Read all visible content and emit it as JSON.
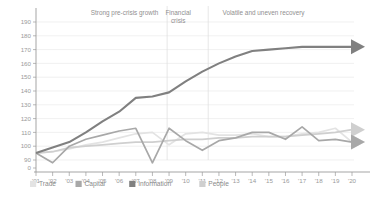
{
  "chart_data": {
    "type": "line",
    "title": "",
    "xlabel": "",
    "ylabel": "",
    "ylim": [
      90,
      195
    ],
    "grid": true,
    "legend_position": "bottom",
    "x": [
      "'01",
      "'02",
      "'03",
      "'04",
      "'05",
      "'06",
      "'07",
      "'08",
      "'09",
      "'10",
      "'11",
      "'12",
      "'13",
      "'14",
      "'15",
      "'16",
      "'17",
      "'18",
      "'19",
      "'20"
    ],
    "ytick_labels": [
      "0",
      "90",
      "100",
      "110",
      "120",
      "130",
      "140",
      "150",
      "160",
      "170",
      "180",
      "190"
    ],
    "ytick_values": [
      0,
      90,
      100,
      110,
      120,
      130,
      140,
      150,
      160,
      170,
      180,
      190
    ],
    "series": [
      {
        "name": "Trade",
        "color": "#e3e3e3",
        "values": [
          95,
          96,
          98,
          101,
          103,
          106,
          109,
          110,
          101,
          109,
          110,
          108,
          108,
          109,
          107,
          107,
          109,
          110,
          113,
          103
        ]
      },
      {
        "name": "Capital",
        "color": "#a8a8a8",
        "values": [
          95,
          88,
          100,
          105,
          108,
          111,
          113,
          88,
          113,
          104,
          97,
          104,
          106,
          110,
          110,
          105,
          114,
          104,
          105,
          103
        ]
      },
      {
        "name": "Information",
        "color": "#808080",
        "values": [
          95,
          99,
          103,
          110,
          118,
          125,
          135,
          136,
          139,
          147,
          154,
          160,
          165,
          169,
          170,
          171,
          172,
          172,
          172,
          172
        ]
      },
      {
        "name": "People",
        "color": "#cfcfcf",
        "values": [
          95,
          96,
          99,
          100,
          101,
          102,
          103,
          103,
          104,
          105,
          105,
          106,
          106,
          107,
          107,
          107,
          108,
          109,
          110,
          112
        ]
      }
    ],
    "annotations": [
      {
        "text": "Strong pre-crisis growth",
        "lines": [
          "Strong pre-crisis growth"
        ],
        "x_center_pct": 28
      },
      {
        "text": "Financial crisis",
        "lines": [
          "Financial",
          "crisis"
        ],
        "x_center_pct": 45
      },
      {
        "text": "Volatile and uneven recovery",
        "lines": [
          "Volatile and uneven recovery"
        ],
        "x_center_pct": 72
      }
    ],
    "legend": [
      {
        "label": "Trade",
        "color": "#e3e3e3"
      },
      {
        "label": "Capital",
        "color": "#a8a8a8"
      },
      {
        "label": "Information",
        "color": "#808080"
      },
      {
        "label": "People",
        "color": "#cfcfcf"
      }
    ]
  }
}
